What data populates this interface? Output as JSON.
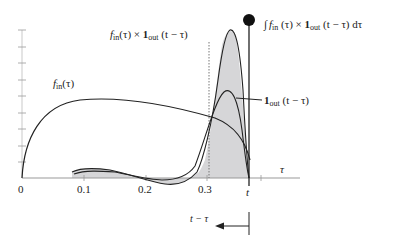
{
  "labels": {
    "product_f": "f",
    "product_f_sub": "in",
    "product_arg": "(τ) × ",
    "product_one": "1",
    "product_one_sub": "out",
    "product_tail": " (t − τ)",
    "integral_sign": "∫",
    "integral_f": "f",
    "integral_f_sub": "in",
    "integral_arg": " (τ) × ",
    "integral_one": "1",
    "integral_one_sub": "out",
    "integral_tail": " (t − τ) dτ",
    "fin_f": "f",
    "fin_sub": "in",
    "fin_arg": "(τ)",
    "indicator_one": "1",
    "indicator_sub": "out",
    "indicator_tail": " (t − τ)",
    "tau_axis": "τ",
    "t_mark": "t",
    "shift_label": "t − τ"
  },
  "x_ticks": [
    "0",
    "0.1",
    "0.2",
    "0.3"
  ],
  "colors": {
    "line": "#222222",
    "fill": "#d6d6d8",
    "axis": "#999999"
  }
}
